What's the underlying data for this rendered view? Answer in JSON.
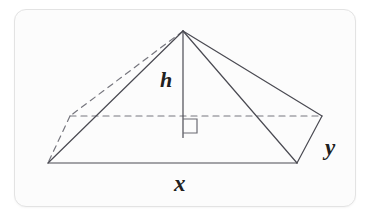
{
  "figure": {
    "kind": "geometry-diagram",
    "card": {
      "background_color": "#fcfcfc",
      "border_color": "#e3e3e3"
    },
    "stroke": {
      "solid_color": "#4a4a52",
      "dashed_color": "#76767e",
      "width": 1.2
    },
    "labels": {
      "height": "h",
      "base_length": "x",
      "base_width": "y"
    },
    "vertices": {
      "apex": [
        183,
        31
      ],
      "front_left": [
        48,
        163
      ],
      "front_right": [
        297,
        163
      ],
      "back_left": [
        70,
        116
      ],
      "back_right": [
        322,
        116
      ],
      "base_center": [
        183,
        137
      ]
    },
    "solid_edges": [
      [
        183,
        31,
        48,
        163
      ],
      [
        183,
        31,
        297,
        163
      ],
      [
        183,
        31,
        322,
        116
      ],
      [
        48,
        163,
        297,
        163
      ],
      [
        297,
        163,
        322,
        116
      ]
    ],
    "dashed_edges": [
      [
        183,
        31,
        70,
        116
      ],
      [
        70,
        116,
        48,
        163
      ],
      [
        70,
        116,
        322,
        116
      ]
    ],
    "height_line": [
      183,
      31,
      183,
      137
    ],
    "right_angle_marker": {
      "x": 183,
      "y": 119,
      "size": 14
    }
  }
}
